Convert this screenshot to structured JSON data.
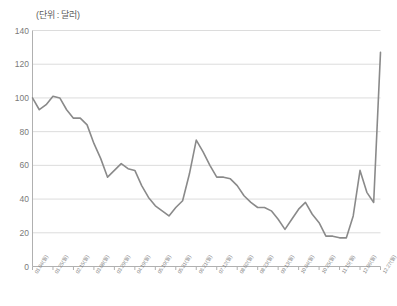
{
  "chart_data": {
    "type": "line",
    "title": "(단위 : 달러)",
    "xlabel": "",
    "ylabel": "",
    "ylim": [
      0,
      140
    ],
    "ytick_values": [
      0,
      20,
      40,
      60,
      80,
      100,
      120,
      140
    ],
    "ytick_labels": [
      "0",
      "20",
      "40",
      "60",
      "80",
      "100",
      "120",
      "140"
    ],
    "grid": true,
    "legend": null,
    "line_color": "#8a8a8a",
    "grid_color": "#dcdcdc",
    "axis_color": "#b0b0b0",
    "categories": [
      "01.04(월)",
      "01.11(월)",
      "01.18(월)",
      "01.25(월)",
      "02.01(월)",
      "02.08(월)",
      "02.15(월)",
      "02.22(월)",
      "03.01(월)",
      "03.08(월)",
      "03.15(월)",
      "03.22(월)",
      "03.29(월)",
      "04.05(월)",
      "04.12(월)",
      "04.19(월)",
      "04.26(월)",
      "05.03(월)",
      "05.10(월)",
      "05.17(월)",
      "05.24(월)",
      "05.31(월)",
      "06.07(월)",
      "06.14(월)",
      "06.21(월)",
      "06.28(월)",
      "07.05(월)",
      "07.12(월)",
      "07.19(월)",
      "07.26(월)",
      "08.02(월)",
      "08.09(월)",
      "08.16(월)",
      "08.23(월)",
      "08.30(월)",
      "09.06(월)",
      "09.13(월)",
      "09.20(월)",
      "09.27(월)",
      "10.04(월)",
      "10.11(월)",
      "10.18(월)",
      "10.25(월)",
      "11.01(월)",
      "11.08(월)",
      "11.15(월)",
      "11.22(월)",
      "11.29(월)",
      "12.06(월)",
      "12.13(월)",
      "12.20(월)",
      "12.27(월)"
    ],
    "values": [
      100,
      93,
      96,
      101,
      100,
      93,
      88,
      88,
      84,
      73,
      64,
      53,
      57,
      61,
      58,
      57,
      48,
      41,
      36,
      33,
      30,
      35,
      39,
      55,
      75,
      68,
      60,
      53,
      53,
      52,
      48,
      42,
      38,
      35,
      35,
      33,
      28,
      22,
      28,
      34,
      38,
      31,
      26,
      18,
      18,
      17,
      17,
      30,
      57,
      44,
      38,
      127
    ],
    "xtick_indices": [
      0,
      3,
      6,
      9,
      12,
      15,
      18,
      21,
      24,
      27,
      30,
      33,
      36,
      39,
      42,
      45,
      48,
      51
    ],
    "annotations": []
  },
  "footer": {
    "caption": ""
  }
}
